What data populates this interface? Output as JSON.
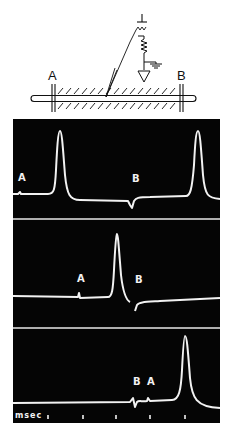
{
  "diagram": {
    "electrode_a_label": "A",
    "electrode_b_label": "B",
    "colors": {
      "ink": "#111111",
      "paper": "#ffffff"
    }
  },
  "traces": {
    "colors": {
      "screen": "#050505",
      "trace": "#f2f2f2",
      "divider": "#e8e8e8"
    },
    "panels": [
      {
        "id": "trace-1",
        "labels": [
          {
            "text": "A",
            "x": 18,
            "y": 181
          },
          {
            "text": "B",
            "x": 132,
            "y": 182
          }
        ],
        "path": "M13,194 L18,194 L20,192 L21,194 L48,194 C54,194 55,190 56,170 C57,150 58,131 60,131 C62,131 63,150 65,175 C67,195 70,200 80,200 L128,201 L130,205 L132,208 L134,201 C136,198 138,197 150,197 L186,196 C190,196 192,190 194,165 C195,145 196,131 198,131 C200,131 201,148 203,175 C205,196 208,198 220,199"
      },
      {
        "id": "trace-2",
        "labels": [
          {
            "text": "A",
            "x": 77,
            "y": 282
          },
          {
            "text": "B",
            "x": 135,
            "y": 283
          }
        ],
        "path": "M13,296 L78,297 L79,293 L80,298 L108,297 C112,297 113,290 114,270 C115,250 116,235 117,234 C118,234 119,250 121,275 C123,292 126,300 130,302 M135,311 L137,305 C139,302 145,302 160,301 L220,298"
      },
      {
        "id": "trace-3",
        "labels": [
          {
            "text": "B",
            "x": 133,
            "y": 385
          },
          {
            "text": "A",
            "x": 147,
            "y": 385
          }
        ],
        "path": "M13,403 L130,402 L133,398 L135,407 L137,402 C139,400 142,402 147,401 L148,398 L150,401 L172,400 C179,400 181,390 182,370 C183,350 184,336 185,336 C187,336 188,352 190,378 C192,398 196,407 220,408"
      }
    ],
    "time_scale": {
      "label": "msec",
      "tick_positions_x": [
        48,
        83,
        116,
        150,
        185
      ]
    }
  }
}
